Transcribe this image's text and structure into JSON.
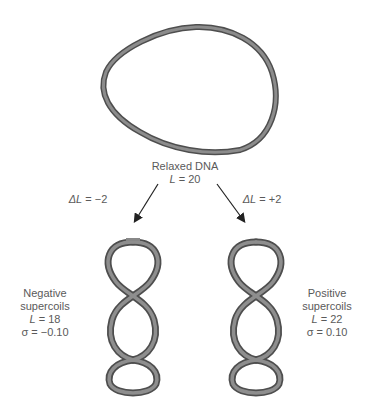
{
  "relaxed": {
    "title": "Relaxed DNA",
    "linking_label": "L",
    "linking_value": "= 20"
  },
  "transitions": {
    "left": {
      "delta_symbol": "ΔL",
      "value": "= −2"
    },
    "right": {
      "delta_symbol": "ΔL",
      "value": "= +2"
    }
  },
  "negative": {
    "title_line1": "Negative",
    "title_line2": "supercoils",
    "linking_label": "L",
    "linking_value": "= 18",
    "sigma_label": "σ",
    "sigma_value": "= −0.10"
  },
  "positive": {
    "title_line1": "Positive",
    "title_line2": "supercoils",
    "linking_label": "L",
    "linking_value": "= 22",
    "sigma_label": "σ",
    "sigma_value": "= 0.10"
  },
  "colors": {
    "strand": "#7a7a7a",
    "strand_dark": "#4a4a4a",
    "arrow": "#222222",
    "text": "#5a5a5a"
  }
}
